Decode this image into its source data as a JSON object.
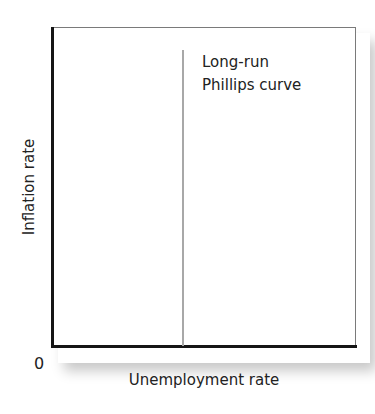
{
  "chart_data": {
    "type": "line",
    "title": "",
    "xlabel": "Unemployment rate",
    "ylabel": "Inflation rate",
    "origin_label": "0",
    "grid": false,
    "legend": null,
    "x_ticks": [],
    "y_ticks": [],
    "series": [
      {
        "name": "Long-run Phillips curve",
        "orientation": "vertical",
        "x_position_fraction": 0.43,
        "y_range_fraction": [
          0.0,
          0.93
        ],
        "color": "#a8a8a8",
        "label_lines": [
          "Long-run",
          "Phillips curve"
        ]
      }
    ],
    "annotations": [
      {
        "text": "Long-run Phillips curve",
        "position": "right of vertical line, near top"
      }
    ]
  },
  "axes": {
    "x_label": "Unemployment rate",
    "y_label": "Inflation rate",
    "origin": "0"
  },
  "curve": {
    "label_line1": "Long-run",
    "label_line2": "Phillips curve"
  },
  "colors": {
    "axis": "#151515",
    "curve": "#a8a8a8",
    "frame": "#7a7a7a",
    "text": "#222222"
  }
}
